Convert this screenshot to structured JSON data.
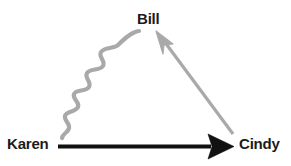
{
  "diagram": {
    "background_color": "#ffffff",
    "width": 291,
    "height": 166,
    "nodes": [
      {
        "id": "bill",
        "label": "Bill",
        "x": 152,
        "y": 19,
        "text_color": "#1b1b1b"
      },
      {
        "id": "karen",
        "label": "Karen",
        "x": 31,
        "y": 144,
        "text_color": "#1b1b1b"
      },
      {
        "id": "cindy",
        "label": "Cindy",
        "x": 262,
        "y": 144,
        "text_color": "#1b1b1b"
      }
    ],
    "edges": [
      {
        "id": "karen-to-bill",
        "from": "karen",
        "to": "bill",
        "style": "wavy",
        "color": "#a9a9a9",
        "thickness": 4,
        "arrowhead": "none"
      },
      {
        "id": "cindy-to-bill",
        "from": "cindy",
        "to": "bill",
        "style": "straight",
        "color": "#a9a9a9",
        "thickness": 3,
        "arrowhead": "open-triangle"
      },
      {
        "id": "karen-to-cindy",
        "from": "karen",
        "to": "cindy",
        "style": "straight",
        "color": "#111111",
        "thickness": 4,
        "arrowhead": "solid-triangle"
      }
    ],
    "colors": {
      "gray_edge": "#a9a9a9",
      "black_edge": "#111111",
      "label_text": "#1b1b1b",
      "canvas": "#ffffff"
    }
  }
}
